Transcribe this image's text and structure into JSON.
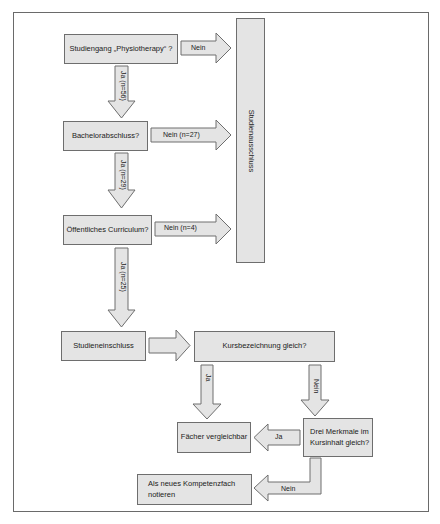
{
  "diagram": {
    "type": "flowchart",
    "nodes": {
      "q_program": "Studiengang „Physiotherapy“ ?",
      "q_bachelor": "Bachelorabschluss?",
      "q_curriculum": "Öffentliches Curriculum?",
      "exclusion": "Studienausschluss",
      "inclusion": "Studieneinschluss",
      "q_course_name": "Kursbezeichnung gleich?",
      "comparable": "Fächer vergleichbar",
      "q_three_features": "Drei Merkmale im Kursinhalt gleich?",
      "new_competency": "Als neues Kompetenzfach notieren"
    },
    "edges": {
      "program_no": "Nein",
      "program_yes": "Ja (n=56)",
      "bachelor_no": "Nein (n=27)",
      "bachelor_yes": "Ja (n=29)",
      "curriculum_no": "Nein (n=4)",
      "curriculum_yes": "Ja (n=25)",
      "course_name_yes": "Ja",
      "course_name_no": "Nein",
      "features_yes": "Ja",
      "features_no": "Nein"
    },
    "colors": {
      "box_fill": "#e4e4e4",
      "box_border": "#6e6e6e",
      "frame_border": "#6a6a6a"
    }
  }
}
